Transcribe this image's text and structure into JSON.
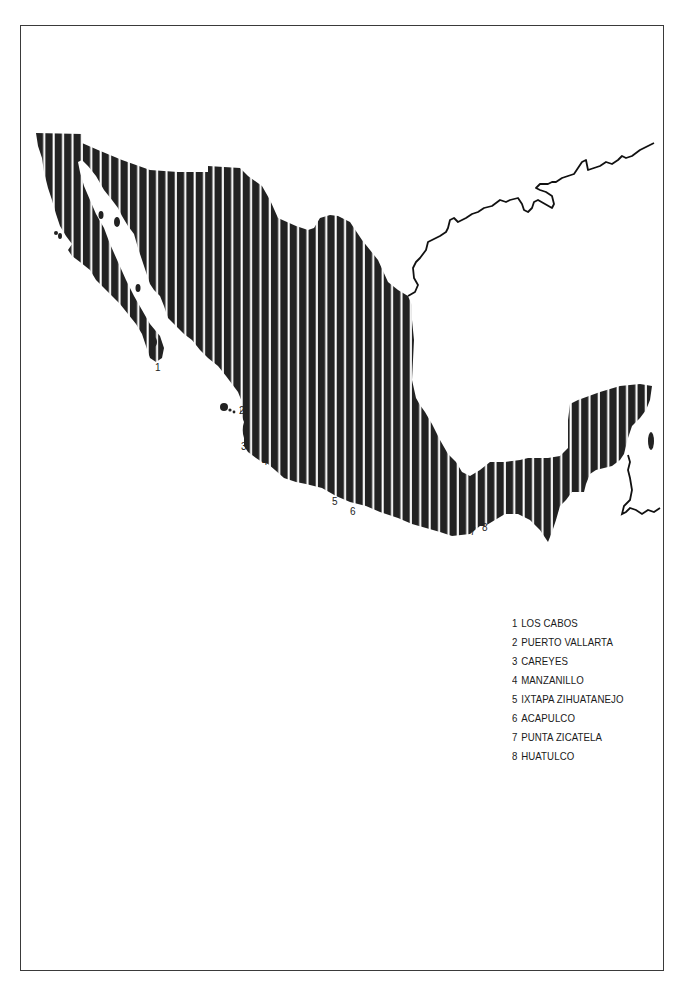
{
  "map": {
    "subject": "Mexico",
    "style": "vertical-stripe fill",
    "colors": {
      "land": "#222222",
      "stripe": "#ffffff",
      "background": "#ffffff",
      "border": "#3a3a3a"
    },
    "markers": [
      {
        "id": "1",
        "label": "1",
        "x": 155,
        "y": 371
      },
      {
        "id": "2",
        "label": "2",
        "x": 239,
        "y": 414
      },
      {
        "id": "3",
        "label": "3",
        "x": 241,
        "y": 450
      },
      {
        "id": "4",
        "label": "4",
        "x": 262,
        "y": 465
      },
      {
        "id": "5",
        "label": "5",
        "x": 332,
        "y": 505
      },
      {
        "id": "6",
        "label": "6",
        "x": 350,
        "y": 515
      },
      {
        "id": "7",
        "label": "7",
        "x": 470,
        "y": 535
      },
      {
        "id": "8",
        "label": "8",
        "x": 482,
        "y": 531
      }
    ]
  },
  "legend": {
    "items": [
      {
        "number": "1",
        "name": "LOS CABOS"
      },
      {
        "number": "2",
        "name": "PUERTO VALLARTA"
      },
      {
        "number": "3",
        "name": "CAREYES"
      },
      {
        "number": "4",
        "name": "MANZANILLO"
      },
      {
        "number": "5",
        "name": "IXTAPA ZIHUATANEJO"
      },
      {
        "number": "6",
        "name": "ACAPULCO"
      },
      {
        "number": "7",
        "name": "PUNTA ZICATELA"
      },
      {
        "number": "8",
        "name": "HUATULCO"
      }
    ]
  }
}
